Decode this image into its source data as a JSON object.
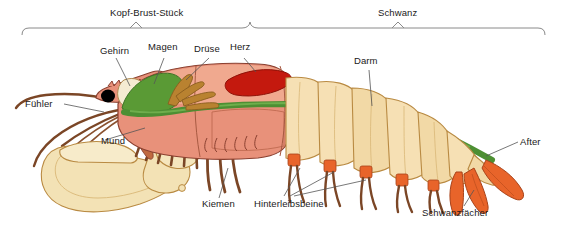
{
  "figure": {
    "kind": "anatomical-diagram",
    "language": "de",
    "background_color": "#ffffff"
  },
  "body_regions": [
    {
      "id": "kopf-brust-stueck",
      "label": "Kopf-Brust-Stück",
      "bracket_from_px": 22,
      "bracket_to_px": 250
    },
    {
      "id": "schwanz",
      "label": "Schwanz",
      "bracket_from_px": 250,
      "bracket_to_px": 545
    }
  ],
  "labels": {
    "gehirn": "Gehirn",
    "magen": "Magen",
    "druese": "Drüse",
    "herz": "Herz",
    "darm": "Darm",
    "fuehler": "Fühler",
    "mund": "Mund",
    "kiemen": "Kiemen",
    "hinterleibsbeine": "Hinterleibsbeine",
    "after": "After",
    "schwanzfaecher": "Schwanzfächer"
  },
  "colors": {
    "cephalothorax": "#e8917a",
    "cephalothorax_light": "#f0a98f",
    "abdomen": "#f6e0b4",
    "abdomen_shade": "#ecd094",
    "claw": "#f3e2b5",
    "heart": "#c4190e",
    "gut": "#4d8f33",
    "gland": "#b98230",
    "brain": "#f5ebd2",
    "eye": "#000000",
    "legs": "#7b4626",
    "tailfan": "#e8642a",
    "outline": "#8a4030",
    "leader_line": "#555555",
    "bracket": "#8a8a8a"
  }
}
